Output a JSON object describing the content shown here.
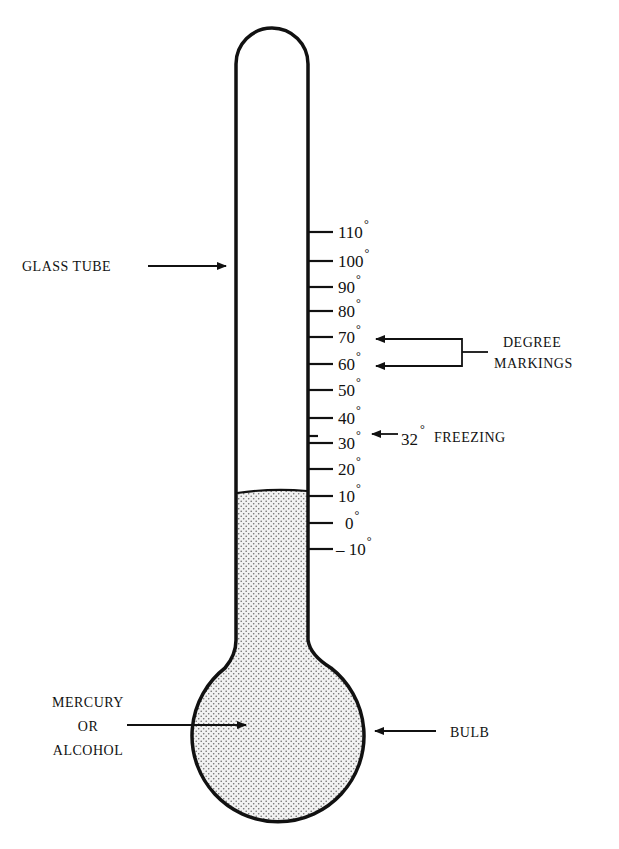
{
  "diagram": {
    "labels": {
      "glass_tube": "GLASS TUBE",
      "degree_markings_line1": "DEGREE",
      "degree_markings_line2": "MARKINGS",
      "freezing_value": "32",
      "freezing_degree": "°",
      "freezing_text": "FREEZING",
      "liquid_line1": "MERCURY",
      "liquid_line2": "OR",
      "liquid_line3": "ALCOHOL",
      "bulb": "BULB"
    },
    "scale": {
      "unit_symbol": "°",
      "ticks": [
        {
          "value": "110",
          "y": 232
        },
        {
          "value": "100",
          "y": 261
        },
        {
          "value": "90",
          "y": 287
        },
        {
          "value": "80",
          "y": 311
        },
        {
          "value": "70",
          "y": 337
        },
        {
          "value": "60",
          "y": 364
        },
        {
          "value": "50",
          "y": 390
        },
        {
          "value": "40",
          "y": 418
        },
        {
          "value": "30",
          "y": 443
        },
        {
          "value": "20",
          "y": 469
        },
        {
          "value": "10",
          "y": 496
        },
        {
          "value": "0",
          "y": 523
        },
        {
          "value": "– 10",
          "y": 549
        }
      ],
      "freezing_tick_y": 436
    },
    "liquid_level": "10",
    "colors": {
      "line": "#111111",
      "liquid_fill": "#d9d9d9",
      "background": "#ffffff"
    }
  }
}
